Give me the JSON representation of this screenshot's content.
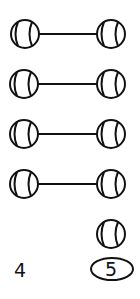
{
  "diagram": {
    "pairs": [
      {
        "left": {
          "cx": 25,
          "cy": 34
        },
        "right": {
          "cx": 111,
          "cy": 34
        }
      },
      {
        "left": {
          "cx": 24,
          "cy": 84
        },
        "right": {
          "cx": 111,
          "cy": 84
        }
      },
      {
        "left": {
          "cx": 24,
          "cy": 134
        },
        "right": {
          "cx": 111,
          "cy": 134
        }
      },
      {
        "left": {
          "cx": 24,
          "cy": 184
        },
        "right": {
          "cx": 111,
          "cy": 184
        }
      }
    ],
    "unpaired": [
      {
        "cx": 111,
        "cy": 234
      }
    ],
    "left_count_label": "4",
    "right_count_label": "5",
    "stroke_color": "#111111"
  }
}
